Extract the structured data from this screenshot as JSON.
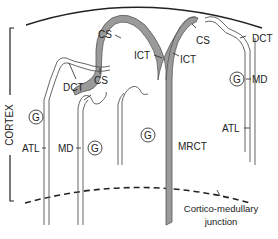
{
  "diagram": {
    "region_label": "CORTEX",
    "labels": {
      "cs_top": "CS",
      "cs_mid": "CS",
      "cs_right": "CS",
      "ict_left": "ICT",
      "ict_right": "ICT",
      "dct_left": "DCT",
      "dct_right": "DCT",
      "md_right": "MD",
      "md_left": "MD",
      "atl_left": "ATL",
      "atl_right": "ATL",
      "mrct": "MRCT",
      "glomerulus": "G"
    },
    "junction_caption_line1": "Cortico-medullary",
    "junction_caption_line2": "junction",
    "colors": {
      "duct_fill": "#9a9a9a",
      "tubule_stroke": "#555555",
      "line": "#222222"
    }
  }
}
